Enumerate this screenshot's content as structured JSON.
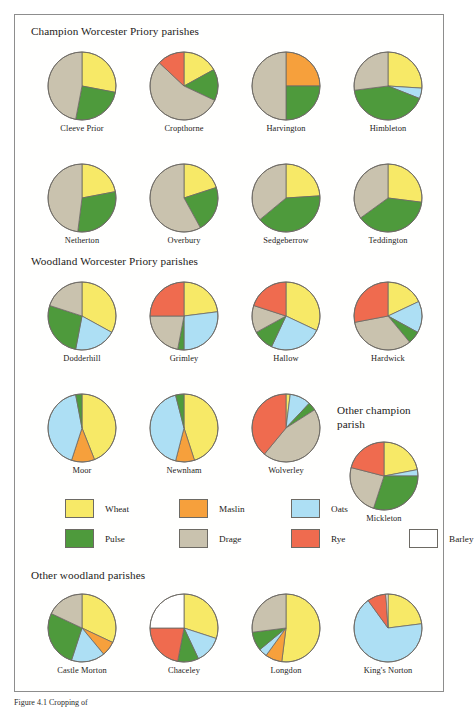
{
  "figure": {
    "caption": "Figure 4.1  Cropping of",
    "frame_color": "#8d8d8d"
  },
  "legend": {
    "items": [
      {
        "name": "Wheat",
        "color": "#f7e967"
      },
      {
        "name": "Maslin",
        "color": "#f6a03c"
      },
      {
        "name": "Oats",
        "color": "#addff4"
      },
      {
        "name": "Pulse",
        "color": "#4e9a3c"
      },
      {
        "name": "Drage",
        "color": "#c9c2ae"
      },
      {
        "name": "Rye",
        "color": "#ef6b4f"
      },
      {
        "name": "Barley",
        "color": "#ffffff"
      }
    ]
  },
  "sections": [
    {
      "id": "champion-priory",
      "title": "Champion Worcester Priory parishes"
    },
    {
      "id": "woodland-priory",
      "title": "Woodland Worcester Priory parishes"
    },
    {
      "id": "other-champion",
      "title": "Other champion parish"
    },
    {
      "id": "other-woodland",
      "title": "Other woodland parishes"
    }
  ],
  "chart_data": {
    "type": "pie",
    "categories": [
      "Wheat",
      "Maslin",
      "Oats",
      "Pulse",
      "Drage",
      "Rye",
      "Barley"
    ],
    "category_colors": {
      "Wheat": "#f7e967",
      "Maslin": "#f6a03c",
      "Oats": "#addff4",
      "Pulse": "#4e9a3c",
      "Drage": "#c9c2ae",
      "Rye": "#ef6b4f",
      "Barley": "#ffffff"
    },
    "units": "percent",
    "groups": [
      {
        "section": "Champion Worcester Priory parishes",
        "pies": [
          {
            "name": "Cleeve Prior",
            "values": {
              "Wheat": 28,
              "Maslin": 0,
              "Oats": 0,
              "Pulse": 25,
              "Drage": 47,
              "Rye": 0,
              "Barley": 0
            }
          },
          {
            "name": "Cropthorne",
            "values": {
              "Wheat": 17,
              "Maslin": 0,
              "Oats": 0,
              "Pulse": 15,
              "Drage": 55,
              "Rye": 13,
              "Barley": 0
            }
          },
          {
            "name": "Harvington",
            "values": {
              "Wheat": 0,
              "Maslin": 25,
              "Oats": 0,
              "Pulse": 25,
              "Drage": 50,
              "Rye": 0,
              "Barley": 0
            }
          },
          {
            "name": "Himbleton",
            "values": {
              "Wheat": 26,
              "Maslin": 0,
              "Oats": 5,
              "Pulse": 42,
              "Drage": 27,
              "Rye": 0,
              "Barley": 0
            }
          },
          {
            "name": "Netherton",
            "values": {
              "Wheat": 22,
              "Maslin": 0,
              "Oats": 0,
              "Pulse": 30,
              "Drage": 48,
              "Rye": 0,
              "Barley": 0
            }
          },
          {
            "name": "Overbury",
            "values": {
              "Wheat": 20,
              "Maslin": 0,
              "Oats": 0,
              "Pulse": 22,
              "Drage": 58,
              "Rye": 0,
              "Barley": 0
            }
          },
          {
            "name": "Sedgeberrow",
            "values": {
              "Wheat": 24,
              "Maslin": 0,
              "Oats": 0,
              "Pulse": 40,
              "Drage": 36,
              "Rye": 0,
              "Barley": 0
            }
          },
          {
            "name": "Teddington",
            "values": {
              "Wheat": 27,
              "Maslin": 0,
              "Oats": 0,
              "Pulse": 38,
              "Drage": 35,
              "Rye": 0,
              "Barley": 0
            }
          }
        ]
      },
      {
        "section": "Woodland Worcester Priory parishes",
        "pies": [
          {
            "name": "Dodderhill",
            "values": {
              "Wheat": 33,
              "Maslin": 0,
              "Oats": 20,
              "Pulse": 27,
              "Drage": 20,
              "Rye": 0,
              "Barley": 0
            }
          },
          {
            "name": "Grimley",
            "values": {
              "Wheat": 23,
              "Maslin": 0,
              "Oats": 27,
              "Pulse": 3,
              "Drage": 22,
              "Rye": 25,
              "Barley": 0
            }
          },
          {
            "name": "Hallow",
            "values": {
              "Wheat": 32,
              "Maslin": 0,
              "Oats": 25,
              "Pulse": 10,
              "Drage": 13,
              "Rye": 20,
              "Barley": 0
            }
          },
          {
            "name": "Hardwick",
            "values": {
              "Wheat": 18,
              "Maslin": 0,
              "Oats": 15,
              "Pulse": 6,
              "Drage": 33,
              "Rye": 28,
              "Barley": 0
            }
          },
          {
            "name": "Moor",
            "values": {
              "Wheat": 44,
              "Maslin": 11,
              "Oats": 42,
              "Pulse": 3,
              "Drage": 0,
              "Rye": 0,
              "Barley": 0
            }
          },
          {
            "name": "Newnham",
            "values": {
              "Wheat": 45,
              "Maslin": 9,
              "Oats": 42,
              "Pulse": 4,
              "Drage": 0,
              "Rye": 0,
              "Barley": 0
            }
          },
          {
            "name": "Wolverley",
            "values": {
              "Wheat": 2,
              "Maslin": 0,
              "Oats": 10,
              "Pulse": 4,
              "Drage": 45,
              "Rye": 39,
              "Barley": 0
            }
          }
        ]
      },
      {
        "section": "Other champion parish",
        "pies": [
          {
            "name": "Mickleton",
            "values": {
              "Wheat": 22,
              "Maslin": 0,
              "Oats": 3,
              "Pulse": 30,
              "Drage": 24,
              "Rye": 21,
              "Barley": 0
            }
          }
        ]
      },
      {
        "section": "Other woodland parishes",
        "pies": [
          {
            "name": "Castle Morton",
            "values": {
              "Wheat": 32,
              "Maslin": 7,
              "Oats": 16,
              "Pulse": 27,
              "Drage": 18,
              "Rye": 0,
              "Barley": 0
            }
          },
          {
            "name": "Chaceley",
            "values": {
              "Wheat": 30,
              "Maslin": 0,
              "Oats": 13,
              "Pulse": 10,
              "Drage": 0,
              "Rye": 22,
              "Barley": 25
            }
          },
          {
            "name": "Longdon",
            "values": {
              "Wheat": 52,
              "Maslin": 8,
              "Oats": 4,
              "Pulse": 9,
              "Drage": 27,
              "Rye": 0,
              "Barley": 0
            }
          },
          {
            "name": "King's Norton",
            "values": {
              "Wheat": 23,
              "Maslin": 0,
              "Oats": 67,
              "Pulse": 0,
              "Drage": 0,
              "Rye": 9,
              "Barley": 1
            }
          }
        ]
      }
    ]
  },
  "layout": {
    "pie_radius": 34,
    "stroke": "#6d6a64",
    "positions": {
      "champion-priory": {
        "heading": {
          "x": 14,
          "y": 12
        },
        "row_y": [
          36,
          148
        ],
        "col_x": [
          32,
          134,
          236,
          338
        ]
      },
      "woodland-priory": {
        "heading": {
          "x": 14,
          "y": 242
        },
        "row_y": [
          266,
          378
        ],
        "col_x": [
          32,
          134,
          236,
          338
        ]
      },
      "other-champion": {
        "heading": {
          "x": 332,
          "y": 392
        },
        "col_x": [
          334
        ],
        "row_y": [
          426
        ]
      },
      "other-woodland": {
        "heading": {
          "x": 14,
          "y": 556
        },
        "row_y": [
          578
        ],
        "col_x": [
          32,
          134,
          236,
          338
        ]
      }
    }
  }
}
